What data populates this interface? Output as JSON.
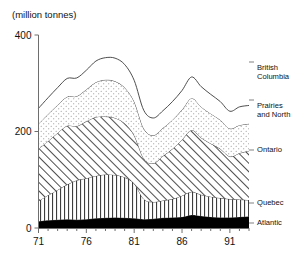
{
  "chart_data": {
    "type": "area",
    "stacked": true,
    "title": "(million tonnes)",
    "xlabel": "",
    "ylabel": "",
    "ylim": [
      0,
      400
    ],
    "xlim": [
      71,
      93
    ],
    "grid": false,
    "legend_position": "right-inline",
    "y_ticks": [
      "400",
      "200",
      "0"
    ],
    "y_tick_values": [
      400,
      200,
      0
    ],
    "x_ticks": [
      "71",
      "76",
      "81",
      "86",
      "91"
    ],
    "x_tick_values": [
      71,
      76,
      81,
      86,
      91
    ],
    "x": [
      71,
      72,
      73,
      74,
      75,
      76,
      77,
      78,
      79,
      80,
      81,
      82,
      83,
      84,
      85,
      86,
      87,
      88,
      89,
      90,
      91,
      92,
      93
    ],
    "series": [
      {
        "name": "Atlantic",
        "fill": "solid-black",
        "values": [
          14,
          16,
          17,
          18,
          17,
          18,
          20,
          21,
          22,
          21,
          20,
          18,
          19,
          21,
          22,
          23,
          27,
          25,
          23,
          22,
          22,
          23,
          24
        ]
      },
      {
        "name": "Quebec",
        "fill": "vertical-lines",
        "values": [
          42,
          52,
          62,
          72,
          82,
          85,
          88,
          90,
          88,
          84,
          72,
          42,
          35,
          36,
          38,
          44,
          48,
          44,
          42,
          40,
          38,
          36,
          34
        ]
      },
      {
        "name": "Ontario",
        "fill": "diagonal-hatch",
        "values": [
          108,
          112,
          118,
          122,
          112,
          118,
          122,
          120,
          118,
          112,
          100,
          84,
          80,
          92,
          104,
          116,
          128,
          118,
          110,
          102,
          88,
          96,
          102
        ]
      },
      {
        "name": "Prairies and North",
        "fill": "dotted",
        "values": [
          52,
          56,
          58,
          60,
          62,
          66,
          72,
          76,
          76,
          74,
          70,
          62,
          58,
          58,
          60,
          62,
          66,
          64,
          62,
          60,
          58,
          58,
          56
        ]
      },
      {
        "name": "British Columbia",
        "fill": "white",
        "values": [
          32,
          34,
          36,
          38,
          38,
          40,
          44,
          46,
          48,
          48,
          44,
          38,
          36,
          36,
          38,
          40,
          44,
          42,
          40,
          38,
          36,
          38,
          38
        ]
      }
    ],
    "legend_entries": [
      {
        "label_line1": "British",
        "label_line2": "Columbia"
      },
      {
        "label_line1": "Prairies",
        "label_line2": "and North"
      },
      {
        "label_line1": "Ontario",
        "label_line2": ""
      },
      {
        "label_line1": "Quebec",
        "label_line2": ""
      },
      {
        "label_line1": "Atlantic",
        "label_line2": ""
      }
    ]
  }
}
